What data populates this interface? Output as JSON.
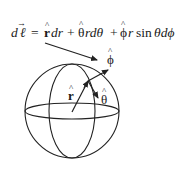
{
  "equation": {
    "lhs": "d",
    "lhs_symbol": "ℓ",
    "equals": "=",
    "term1_unit": "r",
    "term1_rest": "dr",
    "plus1": "+",
    "term2_unit": "θ",
    "term2_rest": "rdθ",
    "plus2": "+",
    "term3_unit": "ϕ",
    "term3_rest_a": "r",
    "term3_sin": "sin",
    "term3_rest_b": "θdϕ",
    "hat": "^",
    "vec_arrow": "→"
  },
  "labels": {
    "r_hat": "r",
    "theta_hat": "θ",
    "phi_hat": "ϕ",
    "hat": "^"
  },
  "colors": {
    "stroke": "#222222",
    "text": "#1a1a1a",
    "background": "#ffffff"
  }
}
